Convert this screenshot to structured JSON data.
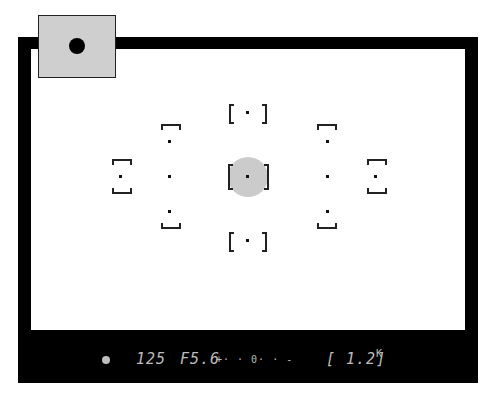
{
  "viewfinder": {
    "title": "Camera viewfinder display",
    "frame_color": "#000000",
    "highlight_color": "#cbcbcb",
    "metering_mode_indicator": {
      "icon": "spot-metering-dot",
      "background": "#cfcfcf"
    },
    "focus_points": {
      "count": 11,
      "selected": "center",
      "points": [
        "top",
        "left-outer",
        "upper-left",
        "left-mid",
        "lower-left",
        "center",
        "upper-right",
        "right-mid",
        "lower-right",
        "right-outer",
        "bottom"
      ]
    }
  },
  "info_bar": {
    "focus_indicator": "●",
    "shutter_speed": "125",
    "aperture": "F5.6",
    "exposure_scale": "+· · 0· · -",
    "frame_count": "[ 1.2]",
    "frame_count_suffix": "K"
  }
}
